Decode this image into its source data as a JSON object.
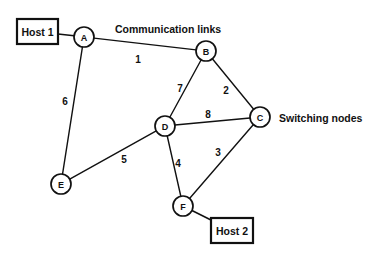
{
  "diagram": {
    "background": "#ffffff",
    "ink": "#111111"
  },
  "annotations": [
    {
      "id": "communication-links",
      "text": "Communication links",
      "x": 115,
      "y": 29,
      "anchor": "start"
    },
    {
      "id": "switching-nodes",
      "text": "Switching nodes",
      "x": 279,
      "y": 118,
      "anchor": "start"
    }
  ],
  "hosts": [
    {
      "id": "host-1",
      "label": "Host 1",
      "x": 17,
      "y": 19,
      "w": 41,
      "h": 25,
      "attach_node": "A"
    },
    {
      "id": "host-2",
      "label": "Host 2",
      "x": 211,
      "y": 218,
      "w": 42,
      "h": 25,
      "attach_node": "F"
    }
  ],
  "nodes": [
    {
      "id": "A",
      "label": "A",
      "x": 84,
      "y": 37,
      "r": 10
    },
    {
      "id": "B",
      "label": "B",
      "x": 206,
      "y": 51,
      "r": 10
    },
    {
      "id": "C",
      "label": "C",
      "x": 260,
      "y": 117,
      "r": 10
    },
    {
      "id": "D",
      "label": "D",
      "x": 165,
      "y": 126,
      "r": 10
    },
    {
      "id": "E",
      "label": "E",
      "x": 61,
      "y": 184,
      "r": 10
    },
    {
      "id": "F",
      "label": "F",
      "x": 183,
      "y": 206,
      "r": 10
    }
  ],
  "edges": [
    {
      "id": "edge-A-B",
      "from": "A",
      "to": "B",
      "weight": "1",
      "lx": 138,
      "ly": 59
    },
    {
      "id": "edge-A-E",
      "from": "A",
      "to": "E",
      "weight": "6",
      "lx": 65,
      "ly": 101
    },
    {
      "id": "edge-B-D",
      "from": "B",
      "to": "D",
      "weight": "7",
      "lx": 180,
      "ly": 88
    },
    {
      "id": "edge-B-C",
      "from": "B",
      "to": "C",
      "weight": "2",
      "lx": 226,
      "ly": 90
    },
    {
      "id": "edge-D-C",
      "from": "D",
      "to": "C",
      "weight": "8",
      "lx": 208,
      "ly": 114
    },
    {
      "id": "edge-C-F",
      "from": "C",
      "to": "F",
      "weight": "3",
      "lx": 218,
      "ly": 152
    },
    {
      "id": "edge-D-F",
      "from": "D",
      "to": "F",
      "weight": "4",
      "lx": 178,
      "ly": 163
    },
    {
      "id": "edge-D-E",
      "from": "D",
      "to": "E",
      "weight": "5",
      "lx": 124,
      "ly": 159
    }
  ],
  "chart_data": {
    "type": "diagram",
    "subtype": "network-graph",
    "node_ids": [
      "A",
      "B",
      "C",
      "D",
      "E",
      "F"
    ],
    "edge_list": [
      {
        "source": "A",
        "target": "B",
        "label": "1"
      },
      {
        "source": "A",
        "target": "E",
        "label": "6"
      },
      {
        "source": "B",
        "target": "D",
        "label": "7"
      },
      {
        "source": "B",
        "target": "C",
        "label": "2"
      },
      {
        "source": "D",
        "target": "C",
        "label": "8"
      },
      {
        "source": "C",
        "target": "F",
        "label": "3"
      },
      {
        "source": "D",
        "target": "F",
        "label": "4"
      },
      {
        "source": "D",
        "target": "E",
        "label": "5"
      }
    ],
    "host_attachments": [
      {
        "host": "Host 1",
        "node": "A"
      },
      {
        "host": "Host 2",
        "node": "F"
      }
    ],
    "legend": [
      "Communication links",
      "Switching nodes"
    ]
  }
}
